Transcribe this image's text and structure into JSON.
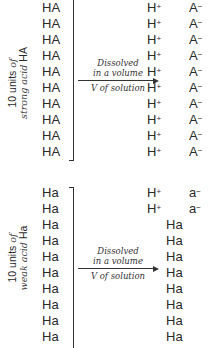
{
  "strong_acid": {
    "side_label": {
      "line1_plain": "10 units ",
      "line1_italic": "of",
      "line2_italic": "strong acid ",
      "line2_plain": "HA"
    },
    "reactants": [
      "HA",
      "HA",
      "HA",
      "HA",
      "HA",
      "HA",
      "HA",
      "HA",
      "HA",
      "HA"
    ],
    "arrow": {
      "line1": "Dissolved",
      "line2": "in a volume",
      "line3": "V of solution"
    },
    "products": {
      "cations": [
        "H",
        "H",
        "H",
        "H",
        "H",
        "H",
        "H",
        "H",
        "H",
        "H"
      ],
      "cation_charge": "+",
      "anions": [
        "A",
        "A",
        "A",
        "A",
        "A",
        "A",
        "A",
        "A",
        "A",
        "A"
      ],
      "anion_charge": "−"
    }
  },
  "weak_acid": {
    "side_label": {
      "line1_plain": "10 units ",
      "line1_italic": "of",
      "line2_italic": "weak acid ",
      "line2_plain": "Ha"
    },
    "reactants": [
      "Ha",
      "Ha",
      "Ha",
      "Ha",
      "Ha",
      "Ha",
      "Ha",
      "Ha",
      "Ha",
      "Ha"
    ],
    "arrow": {
      "line1": "Dissolved",
      "line2": "in a volume",
      "line3": "V of solution"
    },
    "products": {
      "dissociated": [
        {
          "cation": "H",
          "cation_charge": "+",
          "anion": "a",
          "anion_charge": "−"
        },
        {
          "cation": "H",
          "cation_charge": "+",
          "anion": "a",
          "anion_charge": "−"
        }
      ],
      "undissociated": [
        "Ha",
        "Ha",
        "Ha",
        "Ha",
        "Ha",
        "Ha",
        "Ha",
        "Ha"
      ]
    }
  }
}
